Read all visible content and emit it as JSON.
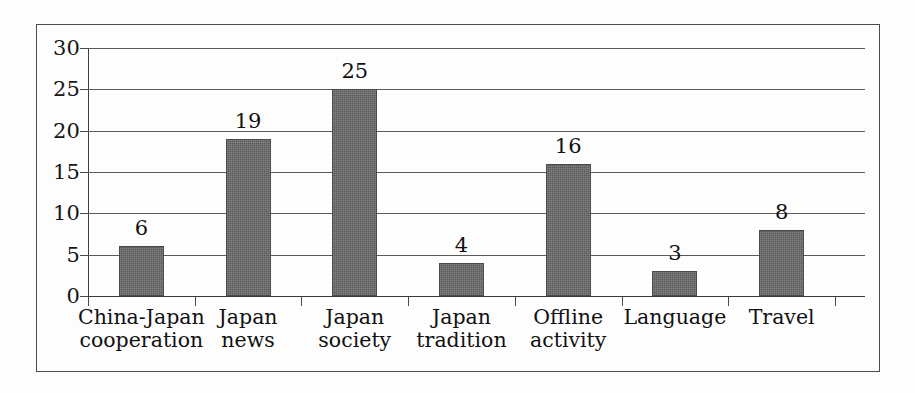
{
  "chart_data": {
    "type": "bar",
    "title": "",
    "subtitle": "",
    "xlabel": "",
    "ylabel": "",
    "categories": [
      "China-Japan\ncooperation",
      "Japan\nnews",
      "Japan\nsociety",
      "Japan\ntradition",
      "Offline\nactivity",
      "Language",
      "Travel"
    ],
    "values": [
      6,
      19,
      25,
      4,
      16,
      3,
      8
    ],
    "data_labels": [
      "6",
      "19",
      "25",
      "4",
      "16",
      "3",
      "8"
    ],
    "ylim": [
      0,
      30
    ],
    "ytick_labels": [
      "0",
      "5",
      "10",
      "15",
      "20",
      "25",
      "30"
    ],
    "ytick_values": [
      0,
      5,
      10,
      15,
      20,
      25,
      30
    ],
    "grid": "horizontal",
    "legend": "none",
    "bar_color": "#595959",
    "grid_color": "#5a5a5a",
    "axis_color": "#3f3f3f",
    "frame_color": "#4c4c4c",
    "background_color": "#fdfdfd",
    "label_color": "#111111"
  }
}
